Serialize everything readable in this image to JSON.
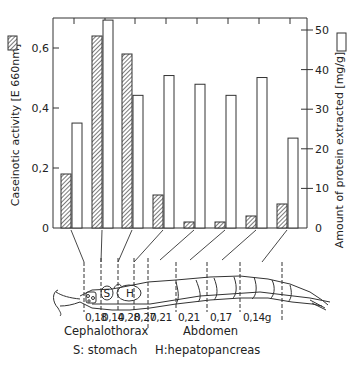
{
  "chart_data": {
    "type": "bar",
    "title": "",
    "categories": [
      "1",
      "2",
      "3",
      "4",
      "5",
      "6",
      "7",
      "8"
    ],
    "series": [
      {
        "name": "Caseinotic activity [E 660nm]",
        "axis": "left",
        "pattern": "hatched",
        "values": [
          0.18,
          0.64,
          0.58,
          0.11,
          0.02,
          0.02,
          0.04,
          0.08
        ]
      },
      {
        "name": "Amount of protein extracted [mg/g]",
        "axis": "right",
        "pattern": "open",
        "values": [
          26.5,
          52.5,
          33.5,
          38.5,
          36.3,
          33.5,
          38.0,
          22.7
        ]
      }
    ],
    "ylabel": "Caseinotic activity [E 660nm]",
    "ylabel_right": "Amount of protein extracted [mg/g]",
    "ylim": [
      0,
      0.7
    ],
    "ylim_right": [
      0,
      53
    ],
    "yticks": [
      "0",
      "0,2",
      "0,4",
      "0,6"
    ],
    "yticks_right": [
      "0",
      "10",
      "20",
      "30",
      "40",
      "50"
    ],
    "grid": false,
    "legend": "inline-in-axis-titles"
  },
  "diagram": {
    "segment_weights": [
      "0,18",
      "0,14",
      "0,28",
      "0,27",
      "0,21",
      "0,21",
      "0,17",
      "0,14g"
    ],
    "sections": [
      "Cephalothorax",
      "Abdomen"
    ],
    "organ_marks": [
      "S",
      "H"
    ],
    "legend": [
      "S: stomach",
      "H:hepatopancreas"
    ]
  }
}
